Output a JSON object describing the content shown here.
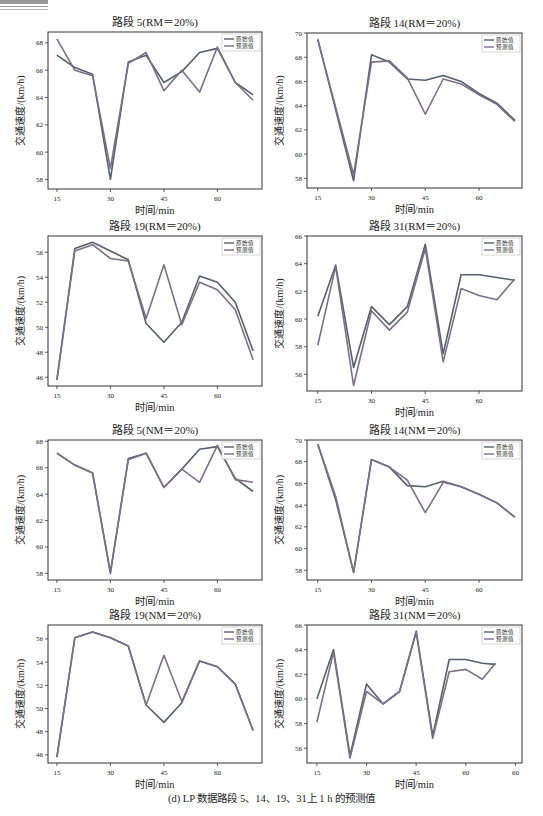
{
  "figure": {
    "caption": "(d) LP 数据路段 5、14、19、31上 1 h 的预测值"
  },
  "colors": {
    "original": "#55606e",
    "predicted": "#7d6e8a",
    "axis": "#333333",
    "text": "#222222"
  },
  "chart_data": [
    {
      "id": "seg5-rm",
      "type": "line",
      "title": "路段 5(RM＝20%)",
      "xlabel": "时间/min",
      "ylabel": "交通速度/(km/h)",
      "x": [
        15,
        20,
        25,
        30,
        35,
        40,
        45,
        50,
        55,
        60,
        65,
        70
      ],
      "xticks": [
        15,
        30,
        45,
        60
      ],
      "xtick_labels": [
        "15",
        "30",
        "45",
        "60"
      ],
      "yticks": [
        58,
        60,
        62,
        64,
        66,
        68
      ],
      "ylim": [
        57.3,
        68.8
      ],
      "xlim": [
        12.5,
        72.5
      ],
      "legend": [
        "原始值",
        "预测值"
      ],
      "legend_position": "upper right",
      "series": [
        {
          "name": "原始值",
          "values": [
            67.1,
            66.2,
            65.7,
            58.0,
            66.6,
            67.1,
            65.1,
            65.9,
            67.3,
            67.6,
            65.1,
            64.2
          ]
        },
        {
          "name": "预测值",
          "values": [
            68.3,
            66.0,
            65.6,
            58.8,
            66.5,
            67.3,
            64.5,
            66.0,
            64.4,
            67.7,
            65.1,
            63.8
          ]
        }
      ]
    },
    {
      "id": "seg14-rm",
      "type": "line",
      "title": "路段 14(RM＝20%)",
      "xlabel": "时间/min",
      "ylabel": "交通速度/(km/h)",
      "x": [
        15,
        25,
        30,
        35,
        40,
        45,
        50,
        55,
        60,
        65,
        70
      ],
      "xticks": [
        15,
        30,
        45,
        60
      ],
      "xtick_labels": [
        "15",
        "30",
        "45",
        "60"
      ],
      "yticks": [
        58,
        60,
        62,
        64,
        66,
        68,
        70
      ],
      "ylim": [
        57.2,
        70.0
      ],
      "xlim": [
        12.0,
        72.0
      ],
      "legend": [
        "原始值",
        "预测值"
      ],
      "legend_position": "upper right",
      "series": [
        {
          "name": "原始值",
          "values": [
            69.5,
            57.8,
            68.2,
            67.6,
            66.2,
            66.1,
            66.5,
            66.0,
            65.0,
            64.2,
            62.8
          ]
        },
        {
          "name": "预测值",
          "values": [
            69.4,
            58.3,
            67.6,
            67.7,
            66.3,
            63.3,
            66.2,
            65.8,
            64.9,
            64.1,
            62.7
          ]
        }
      ]
    },
    {
      "id": "seg19-rm",
      "type": "line",
      "title": "路段 19(RM＝20%)",
      "xlabel": "时间/min",
      "ylabel": "交通速度/(km/h)",
      "x": [
        15,
        20,
        25,
        30,
        35,
        40,
        45,
        50,
        55,
        60,
        65,
        70
      ],
      "xticks": [
        15,
        30,
        45,
        60
      ],
      "xtick_labels": [
        "15",
        "30",
        "45",
        "60"
      ],
      "yticks": [
        46,
        48,
        50,
        52,
        54,
        56
      ],
      "ylim": [
        45.3,
        57.3
      ],
      "xlim": [
        12.5,
        72.5
      ],
      "legend": [
        "原始值",
        "预测值"
      ],
      "legend_position": "upper right",
      "series": [
        {
          "name": "原始值",
          "values": [
            45.8,
            56.3,
            56.8,
            56.1,
            55.4,
            50.3,
            48.8,
            50.4,
            54.1,
            53.6,
            52.0,
            48.1
          ]
        },
        {
          "name": "预测值",
          "values": [
            45.8,
            56.1,
            56.6,
            55.5,
            55.3,
            50.7,
            55.0,
            50.2,
            53.6,
            53.0,
            51.4,
            47.4
          ]
        }
      ]
    },
    {
      "id": "seg31-rm",
      "type": "line",
      "title": "路段 31(RM＝20%)",
      "xlabel": "时间/min",
      "ylabel": "交通速度/(km/h)",
      "x": [
        15,
        20,
        25,
        30,
        35,
        40,
        45,
        50,
        55,
        60,
        65,
        70
      ],
      "xticks": [
        15,
        30,
        45,
        60
      ],
      "xtick_labels": [
        "15",
        "30",
        "45",
        "60"
      ],
      "yticks": [
        56,
        58,
        60,
        62,
        64,
        66
      ],
      "ylim": [
        54.8,
        66.0
      ],
      "xlim": [
        12.0,
        72.0
      ],
      "legend": [
        "原始值",
        "预测值"
      ],
      "legend_position": "upper right",
      "series": [
        {
          "name": "原始值",
          "values": [
            60.2,
            63.9,
            56.5,
            60.9,
            59.6,
            60.9,
            65.4,
            57.5,
            63.2,
            63.2,
            63.0,
            62.8
          ]
        },
        {
          "name": "预测值",
          "values": [
            58.1,
            63.8,
            55.2,
            60.6,
            59.2,
            60.5,
            65.1,
            56.9,
            62.2,
            61.7,
            61.4,
            62.9
          ]
        }
      ]
    },
    {
      "id": "seg5-nm",
      "type": "line",
      "title": "路段 5(NM＝20%)",
      "xlabel": "时间/min",
      "ylabel": "交通速度/(km/h)",
      "x": [
        15,
        20,
        25,
        30,
        35,
        40,
        45,
        50,
        55,
        60,
        65,
        70
      ],
      "xticks": [
        15,
        30,
        45,
        60
      ],
      "xtick_labels": [
        "15",
        "30",
        "45",
        "60"
      ],
      "yticks": [
        58,
        60,
        62,
        64,
        66,
        68
      ],
      "ylim": [
        57.5,
        68.1
      ],
      "xlim": [
        12.5,
        72.5
      ],
      "legend": [
        "原始值",
        "预测值"
      ],
      "legend_position": "upper right",
      "series": [
        {
          "name": "原始值",
          "values": [
            67.1,
            66.2,
            65.6,
            58.0,
            66.7,
            67.1,
            64.5,
            65.9,
            67.4,
            67.6,
            65.2,
            64.2
          ]
        },
        {
          "name": "预测值",
          "values": [
            67.1,
            66.2,
            65.6,
            58.1,
            66.6,
            67.1,
            64.5,
            65.9,
            64.9,
            67.7,
            65.1,
            64.9
          ]
        }
      ]
    },
    {
      "id": "seg14-nm",
      "type": "line",
      "title": "路段 14(NM＝20%)",
      "xlabel": "时间/min",
      "ylabel": "交通速度/(km/h)",
      "x": [
        15,
        20,
        25,
        30,
        35,
        40,
        45,
        50,
        55,
        60,
        65,
        70
      ],
      "xticks": [
        15,
        30,
        45,
        60
      ],
      "xtick_labels": [
        "15",
        "30",
        "45",
        "60"
      ],
      "yticks": [
        58,
        60,
        62,
        64,
        66,
        68,
        70
      ],
      "ylim": [
        57.1,
        70.0
      ],
      "xlim": [
        12.0,
        72.0
      ],
      "legend": [
        "原始值",
        "预测值"
      ],
      "legend_position": "upper right",
      "series": [
        {
          "name": "原始值",
          "values": [
            69.6,
            64.5,
            57.8,
            68.2,
            67.5,
            65.8,
            65.7,
            66.2,
            65.7,
            65.0,
            64.2,
            62.9
          ]
        },
        {
          "name": "预测值",
          "values": [
            69.6,
            64.8,
            57.8,
            68.2,
            67.5,
            66.3,
            63.3,
            66.1,
            65.7,
            65.0,
            64.2,
            62.9
          ]
        }
      ]
    },
    {
      "id": "seg19-nm",
      "type": "line",
      "title": "路段 19(NM＝20%)",
      "xlabel": "时间/min",
      "ylabel": "交通速度/(km/h)",
      "x": [
        15,
        20,
        25,
        30,
        35,
        40,
        45,
        50,
        55,
        60,
        65,
        70
      ],
      "xticks": [
        15,
        30,
        45,
        60
      ],
      "xtick_labels": [
        "15",
        "30",
        "45",
        "60"
      ],
      "yticks": [
        46,
        48,
        50,
        52,
        54,
        56
      ],
      "ylim": [
        45.3,
        57.2
      ],
      "xlim": [
        12.5,
        72.5
      ],
      "legend": [
        "原始值",
        "预测值"
      ],
      "legend_position": "upper right",
      "series": [
        {
          "name": "原始值",
          "values": [
            45.8,
            56.1,
            56.6,
            56.1,
            55.4,
            50.3,
            48.8,
            50.5,
            54.1,
            53.6,
            52.1,
            48.1
          ]
        },
        {
          "name": "预测值",
          "values": [
            45.8,
            56.1,
            56.6,
            56.1,
            55.4,
            50.3,
            54.6,
            50.6,
            54.1,
            53.6,
            52.1,
            48.1
          ]
        }
      ]
    },
    {
      "id": "seg31-nm",
      "type": "line",
      "title": "路段 31(NM＝20%)",
      "xlabel": "时间/min",
      "ylabel": "交通速度/(km/h)",
      "x": [
        15,
        20,
        25,
        30,
        35,
        40,
        45,
        50,
        55,
        60,
        65,
        69
      ],
      "xticks": [
        15,
        30,
        45,
        60,
        75
      ],
      "xtick_labels": [
        "15",
        "30",
        "45",
        "60",
        "60"
      ],
      "yticks": [
        56,
        58,
        60,
        62,
        64,
        66
      ],
      "ylim": [
        54.8,
        66.0
      ],
      "xlim": [
        12.0,
        77.0
      ],
      "legend": [
        "原始值",
        "预测值"
      ],
      "legend_position": "upper right",
      "series": [
        {
          "name": "原始值",
          "values": [
            60.0,
            64.0,
            55.4,
            61.2,
            59.6,
            60.6,
            65.5,
            57.0,
            63.2,
            63.2,
            62.9,
            62.8
          ]
        },
        {
          "name": "预测值",
          "values": [
            58.1,
            63.8,
            55.2,
            60.6,
            59.6,
            60.6,
            65.4,
            56.8,
            62.2,
            62.4,
            61.6,
            62.9
          ]
        }
      ]
    }
  ]
}
